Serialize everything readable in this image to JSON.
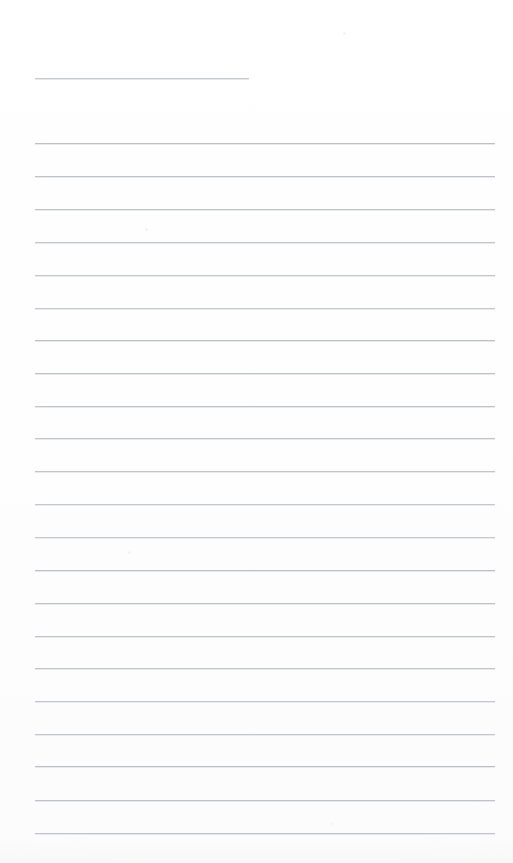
{
  "document": {
    "kind": "scanned-lined-paper",
    "title_text": "",
    "body_text": "",
    "page_width": 513,
    "page_height": 863,
    "background_color": "#fefefe",
    "rule_color": "#b9bdc2",
    "title_rule_color": "#c2c6ca"
  },
  "ruling": {
    "left_margin": 35,
    "right_margin": 18,
    "line_spacing": 32.7,
    "first_line_y": 143,
    "line_count": 22,
    "stroke_width": 1
  },
  "title_rule": {
    "label": "title-rule",
    "x": 35,
    "y": 78,
    "width": 214,
    "height": 1
  },
  "rules": [
    {
      "index": 1,
      "y": 143,
      "x": 35,
      "width": 460
    },
    {
      "index": 2,
      "y": 176,
      "x": 35,
      "width": 460
    },
    {
      "index": 3,
      "y": 209,
      "x": 35,
      "width": 460
    },
    {
      "index": 4,
      "y": 242,
      "x": 35,
      "width": 460
    },
    {
      "index": 5,
      "y": 275,
      "x": 35,
      "width": 460
    },
    {
      "index": 6,
      "y": 308,
      "x": 35,
      "width": 460
    },
    {
      "index": 7,
      "y": 340,
      "x": 35,
      "width": 460
    },
    {
      "index": 8,
      "y": 373,
      "x": 35,
      "width": 460
    },
    {
      "index": 9,
      "y": 406,
      "x": 35,
      "width": 460
    },
    {
      "index": 10,
      "y": 438,
      "x": 35,
      "width": 460
    },
    {
      "index": 11,
      "y": 471,
      "x": 35,
      "width": 460
    },
    {
      "index": 12,
      "y": 504,
      "x": 35,
      "width": 460
    },
    {
      "index": 13,
      "y": 537,
      "x": 35,
      "width": 460
    },
    {
      "index": 14,
      "y": 570,
      "x": 35,
      "width": 460
    },
    {
      "index": 15,
      "y": 603,
      "x": 35,
      "width": 460
    },
    {
      "index": 16,
      "y": 636,
      "x": 35,
      "width": 460
    },
    {
      "index": 17,
      "y": 668,
      "x": 35,
      "width": 460
    },
    {
      "index": 18,
      "y": 701,
      "x": 35,
      "width": 460
    },
    {
      "index": 19,
      "y": 734,
      "x": 35,
      "width": 460
    },
    {
      "index": 20,
      "y": 766,
      "x": 35,
      "width": 460
    },
    {
      "index": 21,
      "y": 800,
      "x": 35,
      "width": 460
    },
    {
      "index": 22,
      "y": 833,
      "x": 35,
      "width": 460
    }
  ],
  "artifacts": {
    "specks": [
      {
        "x": 343,
        "y": 32,
        "size": 3,
        "color": "#f4f4f5"
      },
      {
        "x": 145,
        "y": 228,
        "size": 3,
        "color": "#f3f3f4"
      },
      {
        "x": 128,
        "y": 551,
        "size": 3,
        "color": "#f3f3f4"
      },
      {
        "x": 330,
        "y": 822,
        "size": 3,
        "color": "#f5f5f6"
      }
    ]
  }
}
